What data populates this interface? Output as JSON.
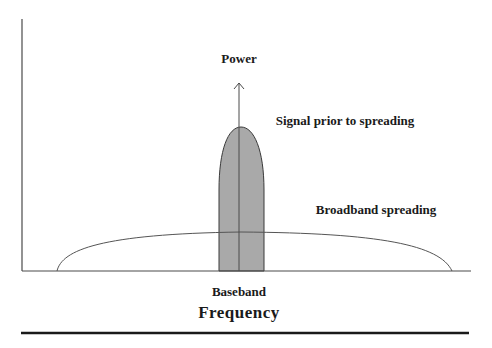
{
  "diagram": {
    "y_axis_label": "Power",
    "x_axis_label": "Frequency",
    "center_label": "Baseband",
    "narrow_signal_label": "Signal prior to spreading",
    "broad_signal_label": "Broadband spreading"
  },
  "colors": {
    "axis": "#4a4a4a",
    "narrow_fill": "#a9a9a9",
    "narrow_stroke": "#3a3a3a",
    "broad_stroke": "#555555",
    "rule": "#1a1a1a",
    "text": "#1a1a1a"
  }
}
